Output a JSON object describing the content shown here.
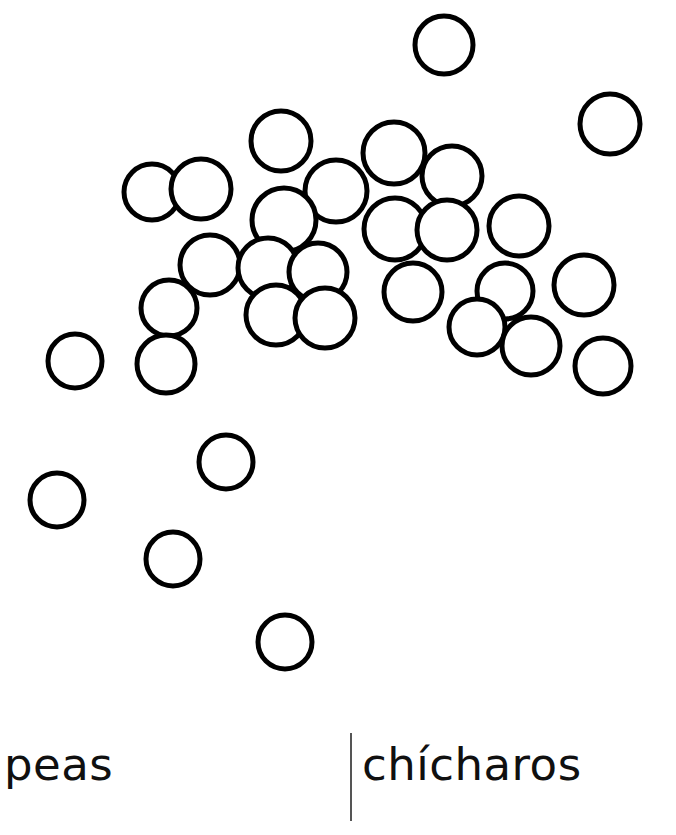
{
  "page": {
    "width": 676,
    "height": 835,
    "background_color": "#ffffff"
  },
  "illustration": {
    "name": "peas-illustration",
    "description": "line-art cluster of peas drawn as open circles",
    "stroke_color": "#000000",
    "fill_color": "#ffffff",
    "stroke_width": 5,
    "circle_count": 34,
    "circles": [
      {
        "cx": 444,
        "cy": 45,
        "r": 29
      },
      {
        "cx": 610,
        "cy": 124,
        "r": 30
      },
      {
        "cx": 281,
        "cy": 141,
        "r": 30
      },
      {
        "cx": 394,
        "cy": 153,
        "r": 31
      },
      {
        "cx": 452,
        "cy": 176,
        "r": 30
      },
      {
        "cx": 152,
        "cy": 192,
        "r": 28
      },
      {
        "cx": 201,
        "cy": 189,
        "r": 30
      },
      {
        "cx": 336,
        "cy": 191,
        "r": 31
      },
      {
        "cx": 284,
        "cy": 220,
        "r": 32
      },
      {
        "cx": 395,
        "cy": 229,
        "r": 31
      },
      {
        "cx": 447,
        "cy": 230,
        "r": 30
      },
      {
        "cx": 519,
        "cy": 226,
        "r": 30
      },
      {
        "cx": 210,
        "cy": 265,
        "r": 30
      },
      {
        "cx": 268,
        "cy": 268,
        "r": 30
      },
      {
        "cx": 318,
        "cy": 272,
        "r": 29
      },
      {
        "cx": 413,
        "cy": 292,
        "r": 29
      },
      {
        "cx": 505,
        "cy": 291,
        "r": 28
      },
      {
        "cx": 584,
        "cy": 285,
        "r": 30
      },
      {
        "cx": 169,
        "cy": 308,
        "r": 28
      },
      {
        "cx": 276,
        "cy": 315,
        "r": 30
      },
      {
        "cx": 325,
        "cy": 318,
        "r": 30
      },
      {
        "cx": 477,
        "cy": 327,
        "r": 28
      },
      {
        "cx": 531,
        "cy": 346,
        "r": 29
      },
      {
        "cx": 75,
        "cy": 361,
        "r": 27
      },
      {
        "cx": 166,
        "cy": 364,
        "r": 29
      },
      {
        "cx": 603,
        "cy": 366,
        "r": 28
      },
      {
        "cx": 226,
        "cy": 462,
        "r": 27
      },
      {
        "cx": 57,
        "cy": 500,
        "r": 27
      },
      {
        "cx": 173,
        "cy": 559,
        "r": 27
      },
      {
        "cx": 285,
        "cy": 642,
        "r": 27
      }
    ]
  },
  "labels": {
    "english": "peas",
    "spanish": "chícharos",
    "divider_color": "#555555"
  }
}
